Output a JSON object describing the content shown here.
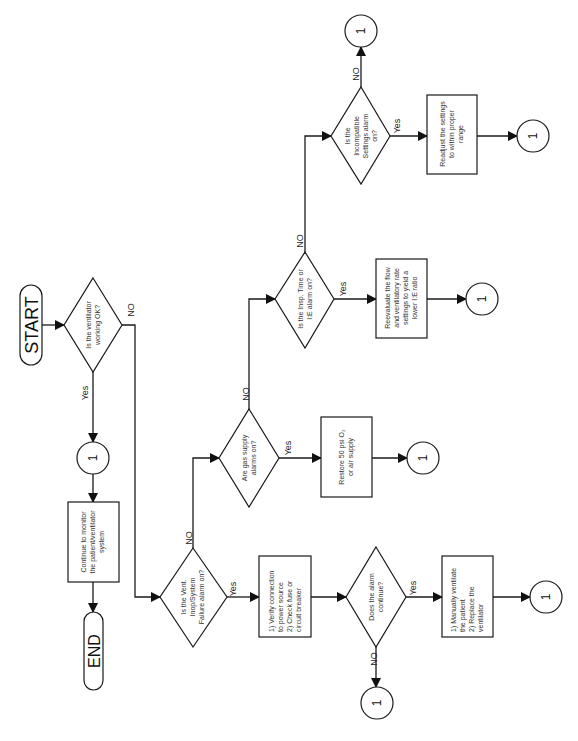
{
  "diagram": {
    "orientation": "rotated 90deg counter-clockwise",
    "terminals": {
      "start": "START",
      "end": "END"
    },
    "connector_label": "1",
    "decisions": {
      "ventilator_ok": [
        "Is the ventilator",
        "working OK?"
      ],
      "vent_inop": [
        "Is the Vent.",
        "Inop/System",
        "Failure alarm on?"
      ],
      "gas_supply": [
        "Are gas supply",
        "alarms on?"
      ],
      "insp_time": [
        "Is the Insp. Time or",
        "I:E alarm on?"
      ],
      "incompatible": [
        "Is the",
        "Incompatible",
        "Settings alarm",
        "on?"
      ],
      "alarm_continue": [
        "Does the alarm",
        "continue?"
      ]
    },
    "processes": {
      "continue_monitor": [
        "Continue to monitor",
        "the patient/ventilator",
        "system"
      ],
      "verify_power": [
        "1) Verify connection",
        "to power source",
        "2)  Check fuse or",
        "circuit breaker"
      ],
      "restore_gas": [
        "Restore 50 psi O₂",
        "or air supply"
      ],
      "reevaluate": [
        "Reevaluate the flow",
        "and ventilatory rate",
        "settings to yield a",
        "lower I:E ratio"
      ],
      "readjust": [
        "Readjust the settings",
        "to within proper",
        "range"
      ],
      "manual_ventilate": [
        "1) Manually ventilate",
        "the patient",
        "2) Replace the",
        "ventilator"
      ]
    },
    "edge_labels": {
      "yes": "Yes",
      "no": "NO"
    }
  }
}
